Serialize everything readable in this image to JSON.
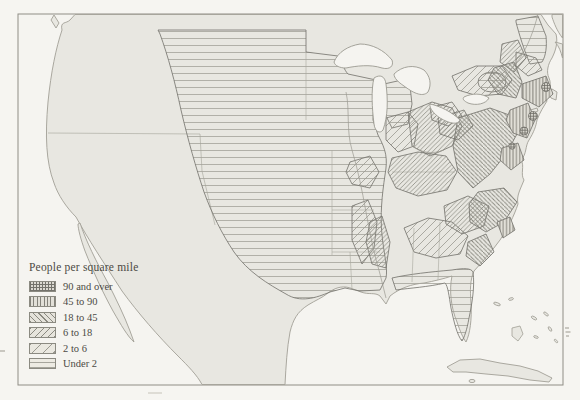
{
  "map": {
    "description": "Scanned book map of the United States showing population density by hatched shading, circa early 1800s",
    "frame_color": "#8f8e86",
    "land_color": "#e8e7e1",
    "water_color": "#f5f4f0",
    "coast_line_color": "#a19f96",
    "region_outline_color": "#71706a"
  },
  "legend": {
    "title": "People per square mile",
    "items": [
      {
        "label": "90 and over",
        "pattern": "crosshatch",
        "line_color": "#74736c"
      },
      {
        "label": "45 to 90",
        "pattern": "vertical-lines",
        "line_color": "#83827a"
      },
      {
        "label": "18 to 45",
        "pattern": "diagonal-backslash-lines",
        "line_color": "#8a8980"
      },
      {
        "label": "6 to 18",
        "pattern": "diagonal-slash-lines-dense",
        "line_color": "#8a8980"
      },
      {
        "label": "2 to 6",
        "pattern": "diagonal-slash-lines-sparse",
        "line_color": "#9a9990"
      },
      {
        "label": "Under 2",
        "pattern": "horizontal-lines",
        "line_color": "#a6a59c"
      }
    ]
  }
}
